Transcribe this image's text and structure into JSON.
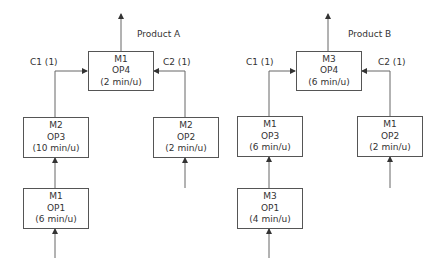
{
  "diagram": {
    "product_a": {
      "label": "Product A",
      "final_op": {
        "machine": "M1",
        "op": "OP4",
        "time": "(2 min/u)"
      },
      "component_1": {
        "label": "C1 (1)"
      },
      "component_2": {
        "label": "C2 (1)"
      },
      "c1_op3": {
        "machine": "M2",
        "op": "OP3",
        "time": "(10 min/u)"
      },
      "c1_op1": {
        "machine": "M1",
        "op": "OP1",
        "time": "(6 min/u)"
      },
      "c2_op2": {
        "machine": "M2",
        "op": "OP2",
        "time": "(2 min/u)"
      }
    },
    "product_b": {
      "label": "Product B",
      "final_op": {
        "machine": "M3",
        "op": "OP4",
        "time": "(6 min/u)"
      },
      "component_1": {
        "label": "C1 (1)"
      },
      "component_2": {
        "label": "C2 (1)"
      },
      "c1_op3": {
        "machine": "M1",
        "op": "OP3",
        "time": "(6 min/u)"
      },
      "c1_op1": {
        "machine": "M3",
        "op": "OP1",
        "time": "(4 min/u)"
      },
      "c2_op2": {
        "machine": "M1",
        "op": "OP2",
        "time": "(2 min/u)"
      }
    },
    "colors": {
      "line": "#555555",
      "text": "#333333",
      "background": "#ffffff"
    }
  }
}
